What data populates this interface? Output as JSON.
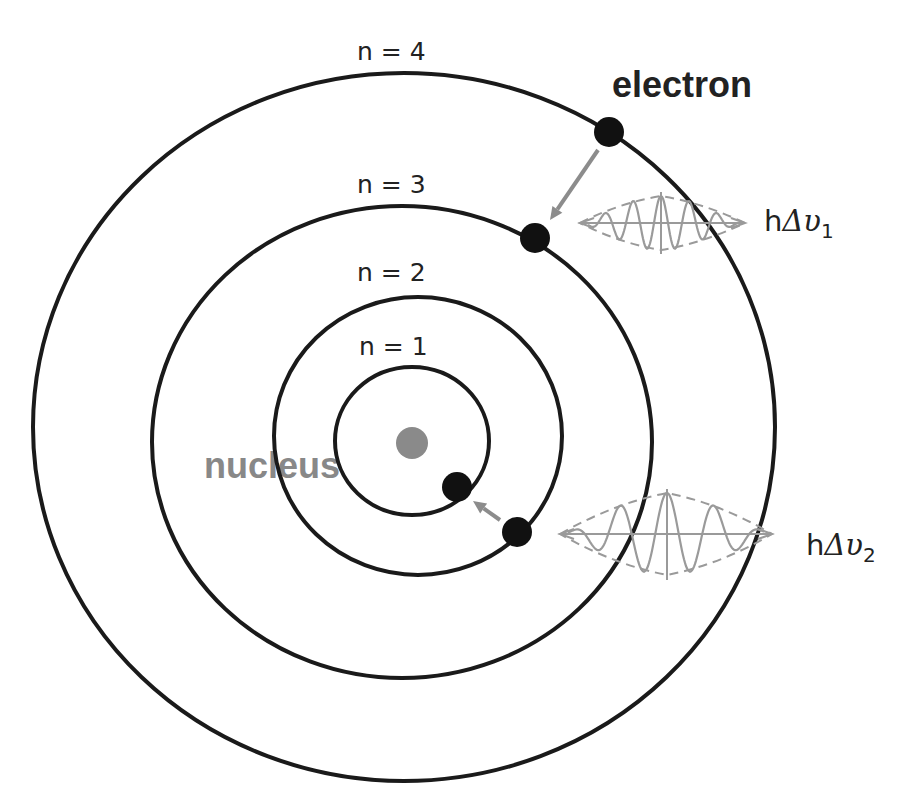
{
  "diagram": {
    "colors": {
      "orbit": "#1a1a1a",
      "electron": "#111111",
      "nucleus": "#8a8a8a",
      "nucleus_label": "#888888",
      "arrow": "#8c8c8c",
      "wave": "#9a9a9a",
      "text": "#222222"
    },
    "nucleus": {
      "label": "nucleus",
      "cx": 412,
      "cy": 443,
      "r": 16,
      "label_x": 204,
      "label_y": 478
    },
    "orbits": [
      {
        "n": 1,
        "label": "n = 1",
        "cx": 412,
        "cy": 441,
        "rx": 77,
        "ry": 74,
        "label_x": 359,
        "label_y": 355
      },
      {
        "n": 2,
        "label": "n = 2",
        "cx": 418,
        "cy": 436,
        "rx": 144,
        "ry": 139,
        "label_x": 357,
        "label_y": 281
      },
      {
        "n": 3,
        "label": "n = 3",
        "cx": 402,
        "cy": 442,
        "rx": 250,
        "ry": 236,
        "label_x": 357,
        "label_y": 193
      },
      {
        "n": 4,
        "label": "n = 4",
        "cx": 404,
        "cy": 427,
        "rx": 371,
        "ry": 354,
        "label_x": 357,
        "label_y": 60
      }
    ],
    "electrons": [
      {
        "orbit": 4,
        "cx": 609,
        "cy": 132,
        "r": 15
      },
      {
        "orbit": 3,
        "cx": 535,
        "cy": 238,
        "r": 15
      },
      {
        "orbit": 2,
        "cx": 517,
        "cy": 532,
        "r": 15
      },
      {
        "orbit": 1,
        "cx": 457,
        "cy": 487,
        "r": 15
      }
    ],
    "electron_label": {
      "text": "electron",
      "x": 612,
      "y": 97
    },
    "transitions": [
      {
        "from_orbit": 4,
        "to_orbit": 3,
        "x1": 598,
        "y1": 150,
        "x2": 550,
        "y2": 220
      },
      {
        "from_orbit": 2,
        "to_orbit": 1,
        "x1": 500,
        "y1": 520,
        "x2": 473,
        "y2": 501
      }
    ],
    "photons": [
      {
        "label_h": "h",
        "label_delta": "Δ",
        "label_nu": "υ",
        "label_sub": "1",
        "label_x": 764,
        "label_y": 231,
        "axis_y": 223,
        "x_start": 580,
        "x_end": 745,
        "center_x": 661,
        "amplitude": 27,
        "vert_top": 192,
        "vert_bottom": 254,
        "wavelength": 28
      },
      {
        "label_h": "h",
        "label_delta": "Δ",
        "label_nu": "υ",
        "label_sub": "2",
        "label_x": 806,
        "label_y": 555,
        "axis_y": 534,
        "x_start": 560,
        "x_end": 772,
        "center_x": 667,
        "amplitude": 41,
        "vert_top": 489,
        "vert_bottom": 580,
        "wavelength": 47
      }
    ]
  }
}
